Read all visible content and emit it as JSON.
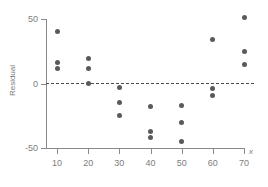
{
  "chart_data": {
    "type": "scatter",
    "title": "",
    "xlabel": "x",
    "ylabel": "Residual",
    "xlim": [
      5,
      75
    ],
    "ylim": [
      -62,
      57
    ],
    "grid": false,
    "legend": null,
    "reference_line": {
      "orientation": "horizontal",
      "value": 0,
      "style": "dashed"
    },
    "xticks": [
      10,
      20,
      30,
      40,
      50,
      60,
      70
    ],
    "xtick_labels": [
      "10",
      "20",
      "30",
      "40",
      "50",
      "60",
      "70"
    ],
    "yticks": [
      50,
      0,
      -50
    ],
    "ytick_labels": [
      "50",
      "0",
      "-50"
    ],
    "marker_color": "#5a5a5a",
    "axis_color": "#8a8a8a",
    "text_color": "#7d7d7d",
    "points": [
      {
        "x": 10,
        "y": 40
      },
      {
        "x": 10,
        "y": 16
      },
      {
        "x": 10,
        "y": 12
      },
      {
        "x": 20,
        "y": 19
      },
      {
        "x": 20,
        "y": 12
      },
      {
        "x": 20,
        "y": 0
      },
      {
        "x": 30,
        "y": -3
      },
      {
        "x": 30,
        "y": -15
      },
      {
        "x": 30,
        "y": -25
      },
      {
        "x": 40,
        "y": -18
      },
      {
        "x": 40,
        "y": -37
      },
      {
        "x": 40,
        "y": -42
      },
      {
        "x": 50,
        "y": -17
      },
      {
        "x": 50,
        "y": -30
      },
      {
        "x": 50,
        "y": -45
      },
      {
        "x": 60,
        "y": 34
      },
      {
        "x": 60,
        "y": -4
      },
      {
        "x": 60,
        "y": -9
      },
      {
        "x": 70,
        "y": 51
      },
      {
        "x": 70,
        "y": 25
      },
      {
        "x": 70,
        "y": 15
      }
    ]
  }
}
